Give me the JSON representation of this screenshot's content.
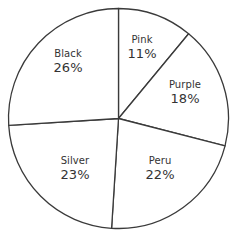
{
  "chart_data": {
    "type": "pie",
    "title": "",
    "subtitle": "",
    "xlabel": "",
    "ylabel": "",
    "grid": false,
    "legend": "none",
    "label_format": "name + percent inside slice",
    "start_angle_deg": 0,
    "direction": "clockwise",
    "categories": [
      "Pink",
      "Purple",
      "Peru",
      "Silver",
      "Black"
    ],
    "values": [
      11,
      18,
      22,
      23,
      26
    ],
    "value_labels": [
      "11%",
      "18%",
      "22%",
      "23%",
      "26%"
    ],
    "units": "percent",
    "total": 100,
    "slices": [
      {
        "name": "Pink",
        "value": 11,
        "value_label": "11%",
        "sweep_deg": 39.6,
        "start_deg": 0,
        "end_deg": 39.6,
        "label_x": 142,
        "label_y": 48
      },
      {
        "name": "Purple",
        "value": 18,
        "value_label": "18%",
        "sweep_deg": 64.8,
        "start_deg": 39.6,
        "end_deg": 104.4,
        "label_x": 185,
        "label_y": 93
      },
      {
        "name": "Peru",
        "value": 22,
        "value_label": "22%",
        "sweep_deg": 79.2,
        "start_deg": 104.4,
        "end_deg": 183.6,
        "label_x": 160,
        "label_y": 169
      },
      {
        "name": "Silver",
        "value": 23,
        "value_label": "23%",
        "sweep_deg": 82.8,
        "start_deg": 183.6,
        "end_deg": 266.4,
        "label_x": 75,
        "label_y": 169
      },
      {
        "name": "Black",
        "value": 26,
        "value_label": "26%",
        "sweep_deg": 93.6,
        "start_deg": 266.4,
        "end_deg": 360,
        "label_x": 68,
        "label_y": 62
      }
    ],
    "geometry": {
      "center_x": 118.5,
      "center_y": 118.5,
      "radius": 110
    },
    "style": {
      "slice_fill": "#ffffff",
      "outline_color": "#3a3a3a",
      "outline_width": 1.3,
      "background": "#ffffff",
      "text_color": "#333333"
    }
  }
}
